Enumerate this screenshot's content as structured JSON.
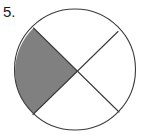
{
  "figure": {
    "question_number": "5.",
    "background_color": "#ffffff",
    "stroke_color": "#3a3a3a",
    "shaded_color": "#808080",
    "unshaded_color": "#ffffff",
    "stroke_width": 1.1,
    "circle": {
      "center_x": 75,
      "center_y": 69.5,
      "radius": 60.5
    },
    "chords": [
      {
        "name": "chord-upper-left-to-lower-right",
        "x1": 33.5,
        "y1": 28.0,
        "x2": 119.0,
        "y2": 112.0
      },
      {
        "name": "chord-lower-left-to-upper-right",
        "x1": 33.0,
        "y1": 114.5,
        "x2": 118.0,
        "y2": 31.5
      }
    ],
    "intersection": {
      "x": 77.5,
      "y": 71.5
    },
    "sectors": [
      {
        "name": "left-sector",
        "shaded": true
      },
      {
        "name": "top-sector",
        "shaded": false
      },
      {
        "name": "right-sector",
        "shaded": false
      },
      {
        "name": "bottom-sector",
        "shaded": false
      }
    ],
    "shaded_count": 1,
    "total_count": 4
  }
}
